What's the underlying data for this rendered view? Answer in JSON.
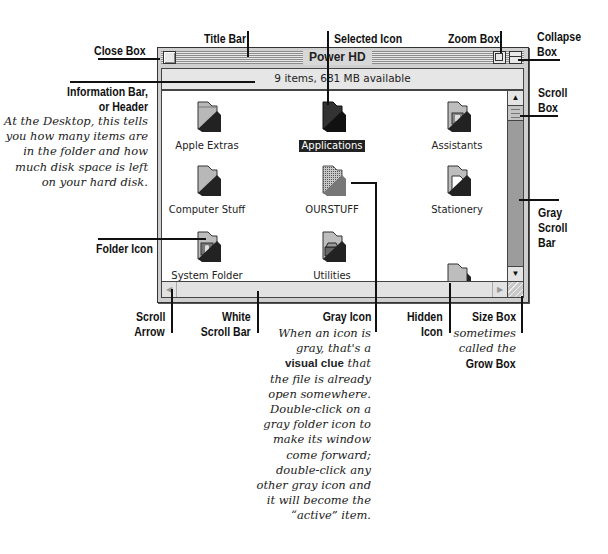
{
  "window": {
    "title": "Power HD",
    "info_bar": "9 items, 681 MB available",
    "scroll_up_arrow": "▲",
    "scroll_down_arrow": "▼",
    "scroll_left_arrow": "◀",
    "scroll_right_arrow": "▶",
    "items": [
      {
        "label": "Apple Extras",
        "icon": "folder-icon",
        "state": "normal"
      },
      {
        "label": "Applications",
        "icon": "folder-icon",
        "state": "selected"
      },
      {
        "label": "Assistants",
        "icon": "assistants-folder-icon",
        "state": "normal"
      },
      {
        "label": "Computer Stuff",
        "icon": "folder-icon",
        "state": "normal"
      },
      {
        "label": "OURSTUFF",
        "icon": "folder-icon",
        "state": "gray-open"
      },
      {
        "label": "Stationery",
        "icon": "stationery-folder-icon",
        "state": "normal"
      },
      {
        "label": "System Folder",
        "icon": "system-folder-icon",
        "state": "normal"
      },
      {
        "label": "Utilities",
        "icon": "utilities-folder-icon",
        "state": "normal"
      },
      {
        "label": "",
        "icon": "folder-icon",
        "state": "hidden"
      }
    ]
  },
  "callouts": {
    "close_box": "Close Box",
    "title_bar": "Title Bar",
    "selected_icon": "Selected Icon",
    "zoom_box": "Zoom Box",
    "collapse_box_1": "Collapse",
    "collapse_box_2": "Box",
    "info_bar_1": "Information Bar,",
    "info_bar_2": "or Header",
    "info_bar_note": [
      "At the Desktop, this tells",
      "you how many items are",
      "in the folder and how",
      "much disk space is left",
      "on your hard disk."
    ],
    "scroll_box_1": "Scroll",
    "scroll_box_2": "Box",
    "gray_scroll_bar_1": "Gray",
    "gray_scroll_bar_2": "Scroll",
    "gray_scroll_bar_3": "Bar",
    "folder_icon": "Folder Icon",
    "scroll_arrow_1": "Scroll",
    "scroll_arrow_2": "Arrow",
    "white_scroll_bar_1": "White",
    "white_scroll_bar_2": "Scroll Bar",
    "gray_icon": "Gray Icon",
    "gray_icon_note": {
      "line1": "When an icon is",
      "line2": "gray, that's a",
      "bold": "visual clue",
      "line3_rest": " that",
      "rest": [
        "the file is already",
        "open somewhere.",
        "Double-click on a",
        "gray folder icon to",
        "make its window",
        "come forward;",
        "double-click any",
        "other gray icon and",
        "it will become the",
        "“active” item."
      ]
    },
    "hidden_icon_1": "Hidden",
    "hidden_icon_2": "Icon",
    "size_box": "Size Box",
    "size_box_note_1": "sometimes",
    "size_box_note_2": "called the",
    "size_box_note_3": "Grow Box"
  },
  "colors": {
    "window_frame": "#cfcfcf",
    "scroll_gray": "#9c9c9c",
    "selection": "#222222",
    "folder": "#b5b5b5"
  }
}
